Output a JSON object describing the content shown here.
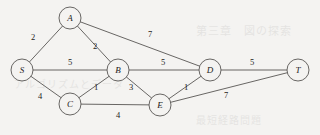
{
  "figure": {
    "kind": "weighted-undirected-graph",
    "source_label": "S",
    "sink_label": "T"
  },
  "style": {
    "background": "#f4f3f1",
    "line_color": "#585654",
    "text_color": "#1d1b1a",
    "node_radius": 11
  },
  "nodes": [
    {
      "id": "S",
      "label": "S",
      "x": 22,
      "y": 70
    },
    {
      "id": "A",
      "label": "A",
      "x": 70,
      "y": 18
    },
    {
      "id": "B",
      "label": "B",
      "x": 118,
      "y": 70
    },
    {
      "id": "C",
      "label": "C",
      "x": 70,
      "y": 104
    },
    {
      "id": "D",
      "label": "D",
      "x": 210,
      "y": 70
    },
    {
      "id": "E",
      "label": "E",
      "x": 160,
      "y": 105
    },
    {
      "id": "T",
      "label": "T",
      "x": 298,
      "y": 70
    }
  ],
  "edges": [
    {
      "from": "S",
      "to": "A",
      "weight": "2",
      "lx": 33,
      "ly": 38
    },
    {
      "from": "S",
      "to": "B",
      "weight": "5",
      "lx": 70,
      "ly": 63
    },
    {
      "from": "S",
      "to": "C",
      "weight": "4",
      "lx": 40,
      "ly": 97
    },
    {
      "from": "A",
      "to": "B",
      "weight": "2",
      "lx": 95,
      "ly": 47
    },
    {
      "from": "A",
      "to": "D",
      "weight": "7",
      "lx": 150,
      "ly": 35
    },
    {
      "from": "B",
      "to": "D",
      "weight": "5",
      "lx": 163,
      "ly": 63
    },
    {
      "from": "B",
      "to": "C",
      "weight": "1",
      "lx": 96,
      "ly": 88
    },
    {
      "from": "B",
      "to": "E",
      "weight": "3",
      "lx": 131,
      "ly": 88
    },
    {
      "from": "C",
      "to": "E",
      "weight": "4",
      "lx": 118,
      "ly": 116
    },
    {
      "from": "D",
      "to": "E",
      "weight": "1",
      "lx": 186,
      "ly": 88
    },
    {
      "from": "D",
      "to": "T",
      "weight": "5",
      "lx": 252,
      "ly": 63
    },
    {
      "from": "E",
      "to": "T",
      "weight": "7",
      "lx": 226,
      "ly": 96
    }
  ],
  "bleedthrough": [
    {
      "text": "第三章　図の探索",
      "x": 196,
      "y": 22,
      "size": 11
    },
    {
      "text": "アルゴリズムとデータ",
      "x": 14,
      "y": 76,
      "size": 10
    },
    {
      "text": "最短経路問題",
      "x": 196,
      "y": 112,
      "size": 10
    }
  ]
}
